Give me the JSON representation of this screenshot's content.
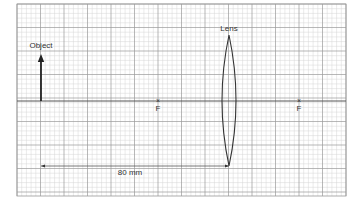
{
  "diagram": {
    "type": "ray-diagram-grid",
    "grid": {
      "x0": 17,
      "y0": 4,
      "x1": 346,
      "y1": 196,
      "major_spacing": 23.5,
      "minor_per_major": 5,
      "major_color": "#9a9a9a",
      "minor_color": "#d6d6d6"
    },
    "principal_axis": {
      "y": 101,
      "color": "#555555"
    },
    "object": {
      "label": "Object",
      "x": 41,
      "base_y": 101,
      "tip_y": 54
    },
    "lens": {
      "label": "Lens",
      "x": 229,
      "top_y": 35,
      "bottom_y": 166,
      "half_width": 7
    },
    "focal_points": [
      {
        "label": "F",
        "marker": "×",
        "x": 158
      },
      {
        "label": "F",
        "marker": "×",
        "x": 299
      }
    ],
    "distance": {
      "label": "80 mm",
      "y": 166,
      "x_start": 41,
      "x_end": 229
    }
  }
}
